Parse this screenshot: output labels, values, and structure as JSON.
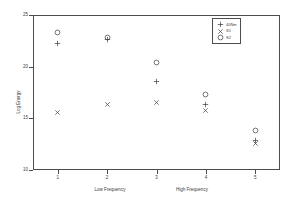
{
  "chart_data": {
    "type": "scatter",
    "title": "",
    "xlabel": "",
    "ylabel": "Log Energy",
    "xlabel_low": "Low Frequency",
    "xlabel_high": "High Frequency",
    "grid": false,
    "legend_position": "top-right",
    "xlim": [
      0.5,
      5.5
    ],
    "ylim": [
      10,
      25
    ],
    "xticks": [
      "1",
      "2",
      "3",
      "4",
      "5"
    ],
    "xtick_values": [
      1,
      2,
      3,
      4,
      5
    ],
    "yticks": [
      "25",
      "20",
      "15",
      "10"
    ],
    "ytick_values": [
      25,
      20,
      15,
      10
    ],
    "series": [
      {
        "name": "40Nm",
        "marker": "plus-marker",
        "color": "#3a3a3a",
        "x": [
          1,
          2,
          3,
          4,
          5
        ],
        "values": [
          22.2,
          22.6,
          18.6,
          16.3,
          12.9
        ]
      },
      {
        "name": "S1",
        "marker": "cross-marker",
        "color": "#3a3a3a",
        "x": [
          1,
          2,
          3,
          4,
          5
        ],
        "values": [
          15.6,
          16.3,
          16.5,
          15.8,
          12.6
        ]
      },
      {
        "name": "S2",
        "marker": "circle-marker",
        "color": "#3a3a3a",
        "x": [
          1,
          2,
          3,
          4,
          5
        ],
        "values": [
          23.3,
          22.8,
          20.4,
          17.3,
          13.8
        ]
      }
    ]
  }
}
